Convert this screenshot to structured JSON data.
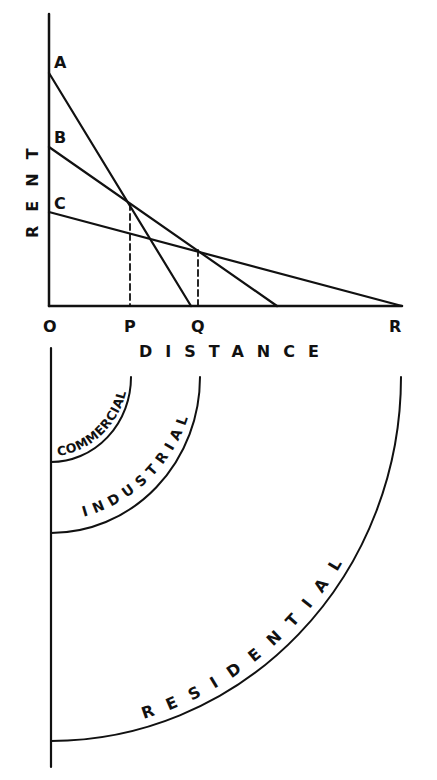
{
  "figure": {
    "rent_axis_label": "RENT",
    "distance_axis_label": "DISTANCE",
    "ink_color": "#111111",
    "background_color": "#ffffff"
  },
  "graph": {
    "origin_label": "O",
    "x_ticks": [
      {
        "label": "P",
        "x": 130
      },
      {
        "label": "Q",
        "x": 198
      },
      {
        "label": "R",
        "x": 402
      }
    ],
    "curves": [
      {
        "label": "A",
        "y_intercept": 73,
        "x_intercept": 191
      },
      {
        "label": "B",
        "y_intercept": 147,
        "x_intercept": 277
      },
      {
        "label": "C",
        "y_intercept": 212,
        "x_intercept": 402
      }
    ],
    "intersections": [
      {
        "curves": [
          "A",
          "B"
        ],
        "at": "P"
      },
      {
        "curves": [
          "B",
          "C"
        ],
        "at": "Q"
      }
    ]
  },
  "zones": {
    "items": [
      {
        "label": "COMMERCIAL",
        "order": 1
      },
      {
        "label": "INDUSTRIAL",
        "order": 2
      },
      {
        "label": "RESIDENTIAL",
        "order": 3
      }
    ]
  }
}
